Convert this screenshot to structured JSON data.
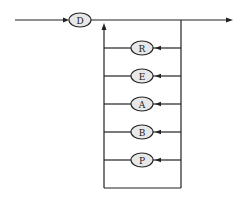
{
  "diagram": {
    "type": "railroad-syntax-diagram",
    "start_node": {
      "label": "D"
    },
    "loop_nodes": [
      {
        "label": "R"
      },
      {
        "label": "E"
      },
      {
        "label": "A"
      },
      {
        "label": "B"
      },
      {
        "label": "P"
      }
    ],
    "colors": {
      "stroke": "#222222",
      "node_fill": "#e8e8e8",
      "background": "#ffffff"
    }
  }
}
